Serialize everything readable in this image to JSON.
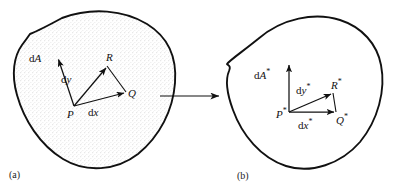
{
  "figure": {
    "background_color": "#ffffff",
    "ink_color": "#111111",
    "stipple_color": "#b9b9b9"
  },
  "panels": [
    {
      "id": "a",
      "caption": "(a)",
      "region_fill": "stippled",
      "labels": {
        "area_vector": "dA",
        "vector_dy": "dy",
        "vector_dx": "dx",
        "point_p": "P",
        "point_q": "Q",
        "point_r": "R"
      }
    },
    {
      "id": "b",
      "caption": "(b)",
      "region_fill": "none",
      "labels": {
        "area_vector": "dA*",
        "vector_dy": "dy*",
        "vector_dx": "dx*",
        "point_p": "P*",
        "point_q": "Q*",
        "point_r": "R*"
      }
    }
  ],
  "connector": {
    "name": "mapping-arrow",
    "direction": "right",
    "label": ""
  }
}
